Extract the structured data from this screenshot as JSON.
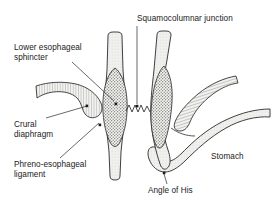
{
  "diagram": {
    "type": "medical-line-drawing",
    "background_color": "#ffffff",
    "line_color": "#1a1a1a",
    "fill_light": "#e8e8e4",
    "fill_stipple": "#9a9a96",
    "text_color": "#1a1a1a"
  },
  "labels": {
    "lower_esophageal_sphincter": "Lower esophageal\nsphincter",
    "crural_diaphragm": "Crural\ndiaphragm",
    "phreno_esophageal_ligament": "Phreno-esophageal\nligament",
    "squamocolumnar_junction": "Squamocolumnar junction",
    "stomach": "Stomach",
    "angle_of_his": "Angle of His"
  },
  "structures": [
    {
      "name": "left-esophagus",
      "description": "vertical tube, light fill"
    },
    {
      "name": "left-les-stipple",
      "description": "elongated dark stippled oval inside left esophagus"
    },
    {
      "name": "left-diaphragm",
      "description": "hatched band curving from left edge toward esophagus"
    },
    {
      "name": "z-line",
      "description": "zigzag line between the two esophageal bodies"
    },
    {
      "name": "right-esophagus",
      "description": "vertical tube angling into stomach"
    },
    {
      "name": "right-les-stipple",
      "description": "elongated dark stippled oval inside right esophagus"
    },
    {
      "name": "right-diaphragm",
      "description": "hatched band curving from right edge downward"
    },
    {
      "name": "stomach-body",
      "description": "curved tubular stippled band sweeping right"
    }
  ],
  "markers": [
    {
      "name": "marker-les",
      "x": 116,
      "y": 104
    },
    {
      "name": "marker-crural",
      "x": 92,
      "y": 106
    },
    {
      "name": "marker-phreno",
      "x": 100,
      "y": 125
    },
    {
      "name": "marker-sqcj",
      "x": 137,
      "y": 107
    },
    {
      "name": "marker-angle",
      "x": 164,
      "y": 172
    }
  ]
}
